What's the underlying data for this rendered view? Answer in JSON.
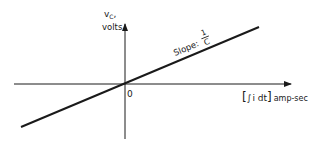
{
  "diagram": {
    "type": "capacitor voltage vs charge plot",
    "y_axis": {
      "label_symbol": "v",
      "label_subscript": "C",
      "label_suffix": ",",
      "unit": "volts"
    },
    "x_axis": {
      "label_open_bracket": "[",
      "label_integral": "∫",
      "label_expr": "i dt",
      "label_close_bracket": "]",
      "unit": "amp-sec"
    },
    "origin_label": "0",
    "line": {
      "annotation_prefix": "Slope:",
      "slope_numerator": "1",
      "slope_denominator": "C"
    },
    "colors": {
      "ink": "#1a1a1a",
      "background": "#ffffff"
    }
  }
}
